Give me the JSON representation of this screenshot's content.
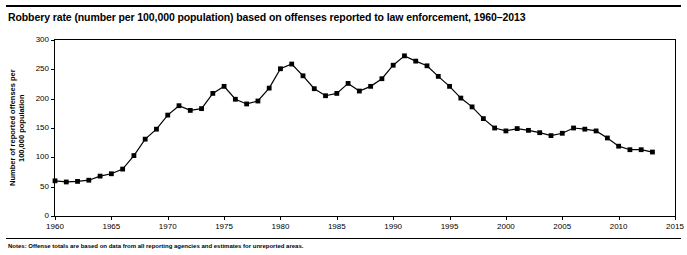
{
  "figure": {
    "title": "Robbery rate (number per 100,000 population) based on offenses reported to law enforcement, 1960–2013",
    "note": "Notes: Offense totals are based on data from all reporting agencies and estimates for unreported areas."
  },
  "chart_data": {
    "type": "line",
    "title": "Robbery rate (number per 100,000 population) based on offenses reported to law enforcement, 1960–2013",
    "xlabel": "",
    "ylabel": "Number of reported offenses per\n100,000 population",
    "xlim": [
      1960,
      2015
    ],
    "ylim": [
      0,
      300
    ],
    "xticks": [
      1960,
      1965,
      1970,
      1975,
      1980,
      1985,
      1990,
      1995,
      2000,
      2005,
      2010,
      2015
    ],
    "yticks": [
      0,
      50,
      100,
      150,
      200,
      250,
      300
    ],
    "grid": false,
    "legend": "none",
    "marker": "square",
    "series": [
      {
        "name": "Robbery rate",
        "x": [
          1960,
          1961,
          1962,
          1963,
          1964,
          1965,
          1966,
          1967,
          1968,
          1969,
          1970,
          1971,
          1972,
          1973,
          1974,
          1975,
          1976,
          1977,
          1978,
          1979,
          1980,
          1981,
          1982,
          1983,
          1984,
          1985,
          1986,
          1987,
          1988,
          1989,
          1990,
          1991,
          1992,
          1993,
          1994,
          1995,
          1996,
          1997,
          1998,
          1999,
          2000,
          2001,
          2002,
          2003,
          2004,
          2005,
          2006,
          2007,
          2008,
          2009,
          2010,
          2011,
          2012,
          2013
        ],
        "values": [
          60,
          58,
          59,
          61,
          68,
          72,
          80,
          103,
          131,
          148,
          172,
          188,
          180,
          183,
          209,
          221,
          199,
          191,
          196,
          218,
          251,
          259,
          239,
          217,
          205,
          209,
          226,
          213,
          221,
          234,
          257,
          273,
          264,
          256,
          238,
          221,
          201,
          186,
          166,
          150,
          145,
          149,
          146,
          142,
          137,
          141,
          150,
          148,
          145,
          133,
          119,
          113,
          113,
          109
        ]
      }
    ]
  }
}
